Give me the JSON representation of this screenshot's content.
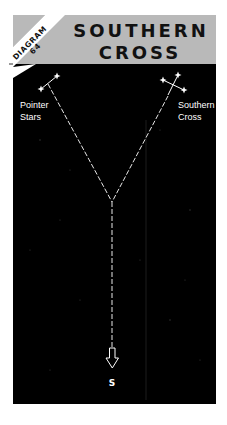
{
  "header": {
    "badge_line1": "DIAGRAM",
    "badge_line2": "64",
    "title_line1": "SOUTHERN",
    "title_line2": "CROSS"
  },
  "labels": {
    "pointer_line1": "Pointer",
    "pointer_line2": "Stars",
    "cross_line1": "Southern",
    "cross_line2": "Cross",
    "south": "S"
  },
  "icons": {
    "star": "star-icon",
    "arrow": "down-arrow-icon"
  },
  "colors": {
    "header_gray": "#b9b9b9",
    "sky": "#000000",
    "band": "#ffffff",
    "line": "#e8e8e8",
    "text_dark": "#111111",
    "text_light": "#ffffff"
  }
}
